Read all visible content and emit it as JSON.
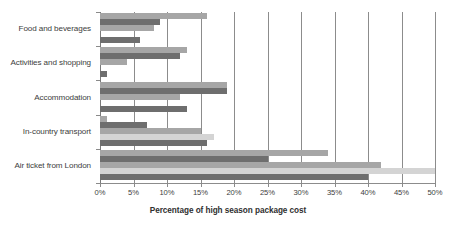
{
  "chart_data": {
    "type": "bar",
    "orientation": "horizontal",
    "title": "",
    "xlabel": "Percentage of high season package cost",
    "ylabel": "",
    "xlim": [
      0,
      50
    ],
    "xtick_labels": [
      "0%",
      "5%",
      "10%",
      "15%",
      "20%",
      "25%",
      "30%",
      "35%",
      "40%",
      "45%",
      "50%"
    ],
    "xtick_values": [
      0,
      5,
      10,
      15,
      20,
      25,
      30,
      35,
      40,
      45,
      50
    ],
    "grid": true,
    "legend": "none",
    "categories": [
      "Food and beverages",
      "Activities and shopping",
      "Accommodation",
      "In-country transport",
      "Air ticket from London"
    ],
    "series": [
      {
        "name": "Series 1",
        "color": "#a6a6a6",
        "values": [
          16,
          13,
          19,
          1,
          34
        ]
      },
      {
        "name": "Series 2",
        "color": "#6e6e6e",
        "values": [
          9,
          12,
          19,
          7,
          25
        ]
      },
      {
        "name": "Series 3",
        "color": "#a6a6a6",
        "values": [
          8,
          4,
          12,
          15,
          42
        ]
      },
      {
        "name": "Series 4",
        "color": "#d4d4d4",
        "values": [
          0,
          0,
          0,
          17,
          50
        ]
      },
      {
        "name": "Series 5",
        "color": "#6e6e6e",
        "values": [
          6,
          1,
          13,
          16,
          40
        ]
      }
    ]
  },
  "colors": {
    "light": "#a6a6a6",
    "dark": "#6e6e6e",
    "pale": "#d4d4d4",
    "grid": "#8c8c8c",
    "text": "#3d3d3d"
  }
}
